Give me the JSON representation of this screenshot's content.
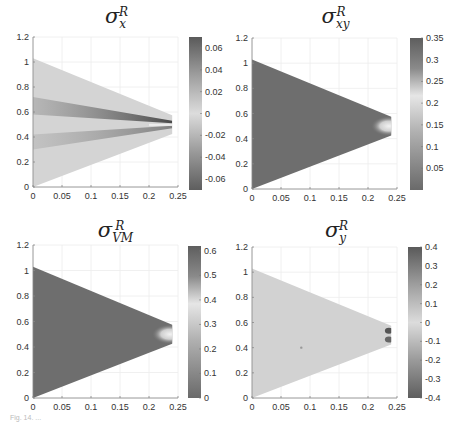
{
  "chart_data": [
    {
      "type": "heatmap",
      "title": "σ_x^R",
      "title_symbol": "σ",
      "title_sub": "x",
      "title_sup": "R",
      "xlabel": "",
      "ylabel": "",
      "xlim": [
        0,
        0.25
      ],
      "ylim": [
        0,
        1.2
      ],
      "xticks": [
        "0",
        "0.05",
        "0.1",
        "0.15",
        "0.2",
        "0.25"
      ],
      "yticks": [
        "0",
        "0.2",
        "0.4",
        "0.6",
        "0.8",
        "1",
        "1.2"
      ],
      "grid": true,
      "domain_shape": "wedge from (0,0)-(0,1.03) tapering to (0.24,0.43)-(0.24,0.57)",
      "colorbar": {
        "min": -0.07,
        "max": 0.07,
        "ticks": [
          "0.06",
          "0.04",
          "0.02",
          "0",
          "-0.02",
          "-0.04",
          "-0.06"
        ]
      },
      "description": "Mostly near 0; darker bands (positive ~0.04) around y≈0.65 and negative (~-0.04) near y≈0.35, converging to strong dark stripes near tip at x≈0.22, y≈0.5"
    },
    {
      "type": "heatmap",
      "title": "σ_xy^R",
      "title_symbol": "σ",
      "title_sub": "xy",
      "title_sup": "R",
      "xlim": [
        0,
        0.25
      ],
      "ylim": [
        0,
        1.2
      ],
      "xticks": [
        "0",
        "0.05",
        "0.1",
        "0.15",
        "0.2",
        "0.25"
      ],
      "yticks": [
        "0",
        "0.2",
        "0.4",
        "0.6",
        "0.8",
        "1",
        "1.2"
      ],
      "grid": true,
      "colorbar": {
        "min": 0,
        "max": 0.35,
        "ticks": [
          "0.35",
          "0.3",
          "0.25",
          "0.2",
          "0.15",
          "0.1",
          "0.05"
        ]
      },
      "description": "Uniformly low (~0) over wedge; elevated values (~0.2) near tip at x≈0.23, y≈0.5"
    },
    {
      "type": "heatmap",
      "title": "σ_VM^R",
      "title_symbol": "σ",
      "title_sub": "VM",
      "title_sup": "R",
      "xlim": [
        0,
        0.25
      ],
      "ylim": [
        0,
        1.2
      ],
      "xticks": [
        "0",
        "0.05",
        "0.1",
        "0.15",
        "0.2",
        "0.25"
      ],
      "yticks": [
        "0",
        "0.2",
        "0.4",
        "0.6",
        "0.8",
        "1",
        "1.2"
      ],
      "grid": true,
      "colorbar": {
        "min": 0,
        "max": 0.62,
        "ticks": [
          "0.6",
          "0.5",
          "0.4",
          "0.3",
          "0.2",
          "0.1",
          "0"
        ]
      },
      "description": "Uniformly low (~0) over wedge; elevated values (~0.4) near tip at x≈0.23, y≈0.5"
    },
    {
      "type": "heatmap",
      "title": "σ_y^R",
      "title_symbol": "σ",
      "title_sub": "y",
      "title_sup": "R",
      "xlim": [
        0,
        0.25
      ],
      "ylim": [
        0,
        1.2
      ],
      "xticks": [
        "0",
        "0.05",
        "0.1",
        "0.15",
        "0.2",
        "0.25"
      ],
      "yticks": [
        "0",
        "0.2",
        "0.4",
        "0.6",
        "0.8",
        "1",
        "1.2"
      ],
      "grid": true,
      "colorbar": {
        "min": -0.4,
        "max": 0.4,
        "ticks": [
          "0.4",
          "0.3",
          "0.2",
          "0.1",
          "0",
          "-0.1",
          "-0.2",
          "-0.3",
          "-0.4"
        ]
      },
      "description": "Near 0 across wedge; two dark spots (|σ|≈0.3) near tip at x≈0.235, y≈0.53 and y≈0.47"
    }
  ],
  "caption": "Fig. 14. ..."
}
